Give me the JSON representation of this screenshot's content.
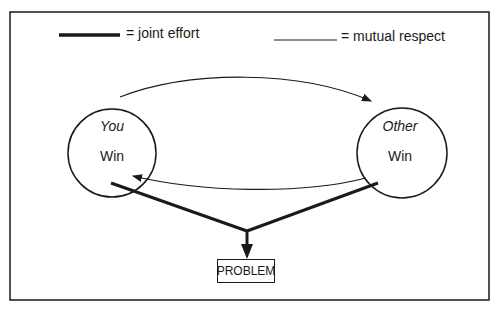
{
  "legend": {
    "joint_effort": {
      "line": "thick",
      "label": "= joint effort"
    },
    "mutual_respect": {
      "line": "thin",
      "label": "= mutual respect"
    }
  },
  "nodes": {
    "you": {
      "title": "You",
      "outcome": "Win"
    },
    "other": {
      "title": "Other",
      "outcome": "Win"
    },
    "problem": {
      "label": "PROBLEM"
    }
  },
  "edges": [
    {
      "from": "you",
      "to": "other",
      "style": "thin",
      "meaning": "mutual respect"
    },
    {
      "from": "other",
      "to": "you",
      "style": "thin",
      "meaning": "mutual respect"
    },
    {
      "from": "you",
      "to": "problem",
      "style": "thick",
      "meaning": "joint effort"
    },
    {
      "from": "other",
      "to": "problem",
      "style": "thick",
      "meaning": "joint effort"
    }
  ],
  "colors": {
    "ink": "#1a1a1a",
    "background": "#ffffff"
  }
}
